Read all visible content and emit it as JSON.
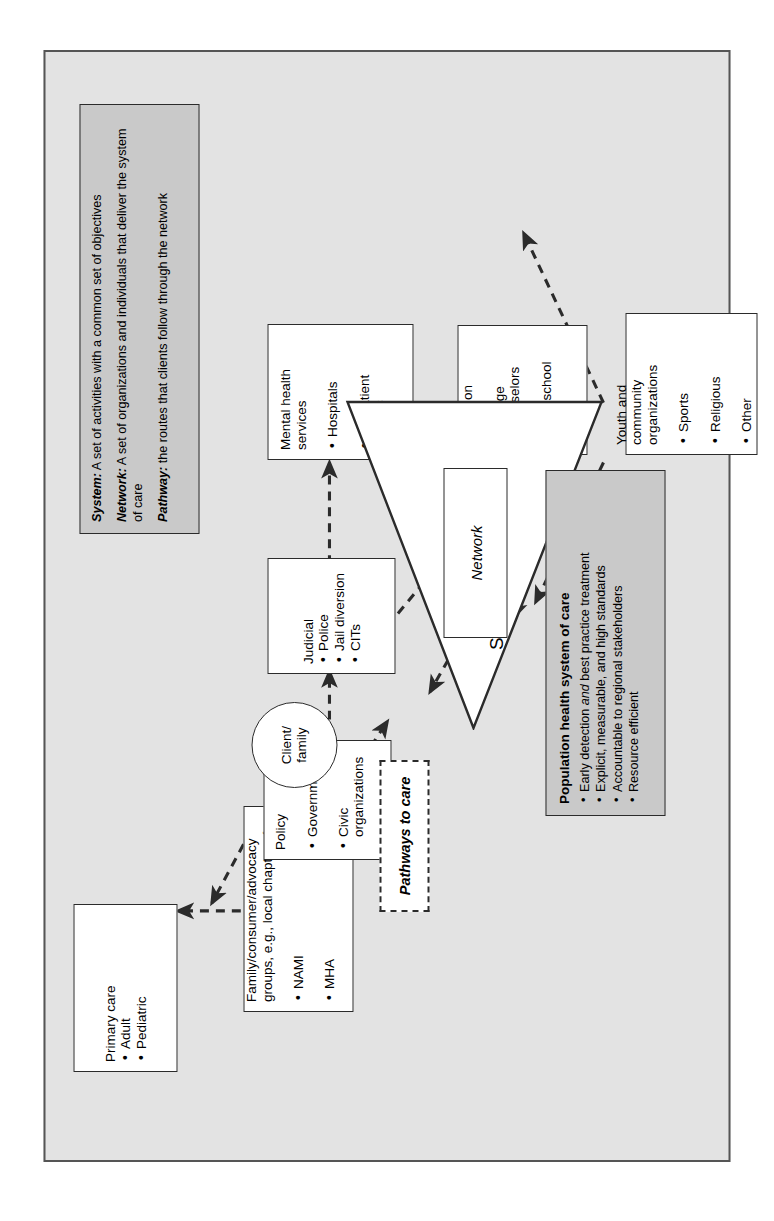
{
  "figure": {
    "background_color": "#e3e3e3",
    "panel_color": "#c9c9c9",
    "border_color": "#2b2b2b",
    "orientation_note": "rotated-90-ccw"
  },
  "center": {
    "clinic_label": "STEP clinic",
    "client_label": "Client/\nfamily",
    "network_label": "Network",
    "pathways_label": "Pathways to care"
  },
  "nodes": [
    {
      "id": "primary-care",
      "title": "Primary care",
      "items": [
        "Adult",
        "Pediatric"
      ]
    },
    {
      "id": "family-advocacy",
      "title": "Family/consumer/advocacy\ngroups, e.g., local chapter of",
      "items": [
        "NAMI",
        "MHA"
      ]
    },
    {
      "id": "policy",
      "title": "Policy",
      "items": [
        "Government",
        "Civic\norganizations"
      ]
    },
    {
      "id": "judicial",
      "title": "Judicial",
      "items": [
        "Police",
        "Jail diversion",
        "CITs"
      ]
    },
    {
      "id": "mental-health-services",
      "title": "Mental health\nservices",
      "items": [
        "Hospitals",
        "Outpatient\nclinics"
      ]
    },
    {
      "id": "education",
      "title": "Education",
      "items": [
        "College\ncounselors",
        "High school\nstaff"
      ]
    },
    {
      "id": "youth-community",
      "title": "Youth and\ncommunity\norganizations",
      "items": [
        "Sports",
        "Religious",
        "Other"
      ]
    }
  ],
  "definitions_panel": {
    "entries": [
      {
        "term": "System:",
        "text": " A set of activities with a common set of objectives"
      },
      {
        "term": "Network:",
        "text": " A set of organizations and individuals that deliver the system of care"
      },
      {
        "term": "Pathway:",
        "text": " the routes that clients follow through the network"
      }
    ]
  },
  "population_panel": {
    "heading": "Population health system of care",
    "bullets": [
      "Early detection and best practice treatment",
      "Explicit, measurable, and high standards",
      "Accountable to regional stakeholders",
      "Resource efficient"
    ],
    "bullet_0_pre": "Early detection ",
    "bullet_0_em": "and",
    "bullet_0_post": " best practice treatment"
  }
}
